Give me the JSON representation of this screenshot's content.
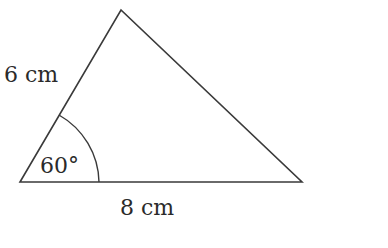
{
  "diagram": {
    "type": "triangle",
    "side_left_label": "6 cm",
    "side_bottom_label": "8 cm",
    "angle_label": "60°",
    "stroke_color": "#3a3a3a"
  }
}
